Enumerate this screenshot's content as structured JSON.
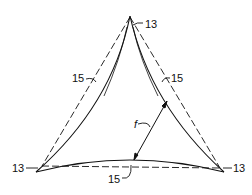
{
  "diagram": {
    "type": "triangle-with-curved-sides",
    "labels": {
      "vertex_top": "13",
      "vertex_left": "13",
      "vertex_right": "13",
      "side_left": "15",
      "side_right": "15",
      "side_bottom": "15",
      "dimension": "f"
    },
    "colors": {
      "stroke": "#111111",
      "background": "#ffffff"
    }
  }
}
